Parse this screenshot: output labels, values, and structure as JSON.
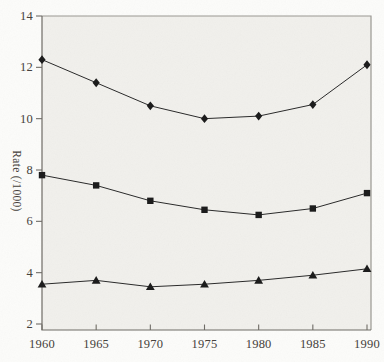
{
  "chart_data": {
    "type": "line",
    "title": "",
    "xlabel": "",
    "ylabel": "Rate (/1000)",
    "x": [
      1960,
      1965,
      1970,
      1975,
      1980,
      1985,
      1990
    ],
    "x_tick_labels": [
      "1960",
      "1965",
      "1970",
      "1975",
      "1980",
      "1985",
      "1990"
    ],
    "y_ticks": [
      2,
      4,
      6,
      8,
      10,
      12,
      14
    ],
    "ylim": [
      2,
      14
    ],
    "grid": false,
    "legend": "none",
    "frame": "full-box",
    "series": [
      {
        "name": "series-1",
        "marker": "diamond",
        "values": [
          12.3,
          11.4,
          10.5,
          10.0,
          10.1,
          10.55,
          12.1
        ]
      },
      {
        "name": "series-2",
        "marker": "square",
        "values": [
          7.8,
          7.4,
          6.8,
          6.45,
          6.25,
          6.5,
          7.1
        ]
      },
      {
        "name": "series-3",
        "marker": "triangle",
        "values": [
          3.55,
          3.7,
          3.45,
          3.55,
          3.7,
          3.9,
          4.15
        ]
      }
    ],
    "colors": {
      "line": "#2b2b2b",
      "marker": "#1c1c1c",
      "frame_light": "#9a9892",
      "frame_dark": "#6f6c66",
      "axis_text": "#46423c",
      "plot_bg": "#f1f0ec",
      "page_bg": "#fcfcfa"
    }
  }
}
